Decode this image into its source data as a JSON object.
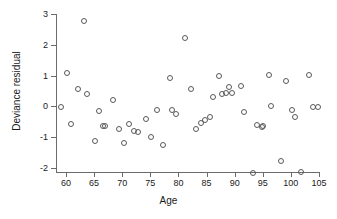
{
  "chart_data": {
    "type": "scatter",
    "title": "",
    "xlabel": "Age",
    "ylabel": "Deviance residual",
    "xlim": [
      58.0,
      105.5
    ],
    "ylim": [
      -2.35,
      3.0
    ],
    "xticks": [
      60,
      65,
      70,
      75,
      80,
      85,
      90,
      95,
      100,
      105
    ],
    "yticks": [
      -2,
      -1,
      0,
      1,
      2,
      3
    ],
    "xtick_labels": [
      "60",
      "65",
      "70",
      "75",
      "80",
      "85",
      "90",
      "95",
      "100",
      "105"
    ],
    "ytick_labels": [
      "-2",
      "-1",
      "0",
      "1",
      "2",
      "3"
    ],
    "grid": false,
    "legend": null,
    "marker": "open-circle",
    "marker_color": "#595959",
    "axis_color": "#6b6b6b",
    "points": [
      {
        "x": 59.0,
        "y": 0.0
      },
      {
        "x": 60.0,
        "y": 1.12
      },
      {
        "x": 60.7,
        "y": -0.54
      },
      {
        "x": 62.0,
        "y": 0.61
      },
      {
        "x": 63.0,
        "y": 2.8
      },
      {
        "x": 63.5,
        "y": 0.45
      },
      {
        "x": 65.0,
        "y": -1.1
      },
      {
        "x": 65.7,
        "y": -0.12
      },
      {
        "x": 66.4,
        "y": -0.62
      },
      {
        "x": 66.8,
        "y": -0.6
      },
      {
        "x": 68.2,
        "y": 0.23
      },
      {
        "x": 69.2,
        "y": -0.7
      },
      {
        "x": 70.1,
        "y": -1.17
      },
      {
        "x": 71.0,
        "y": -0.55
      },
      {
        "x": 72.0,
        "y": -0.78
      },
      {
        "x": 72.6,
        "y": -0.79
      },
      {
        "x": 74.0,
        "y": -0.38
      },
      {
        "x": 75.0,
        "y": -0.95
      },
      {
        "x": 76.0,
        "y": -0.1
      },
      {
        "x": 77.0,
        "y": -1.23
      },
      {
        "x": 78.4,
        "y": 0.95
      },
      {
        "x": 78.7,
        "y": -0.09
      },
      {
        "x": 79.4,
        "y": -0.2
      },
      {
        "x": 81.0,
        "y": 2.24
      },
      {
        "x": 82.0,
        "y": 0.61
      },
      {
        "x": 83.0,
        "y": -0.7
      },
      {
        "x": 83.9,
        "y": -0.5
      },
      {
        "x": 84.5,
        "y": -0.42
      },
      {
        "x": 85.4,
        "y": -0.3
      },
      {
        "x": 86.0,
        "y": 0.35
      },
      {
        "x": 87.0,
        "y": 1.01
      },
      {
        "x": 87.6,
        "y": 0.44
      },
      {
        "x": 88.2,
        "y": 0.46
      },
      {
        "x": 88.8,
        "y": 0.67
      },
      {
        "x": 89.4,
        "y": 0.48
      },
      {
        "x": 91.0,
        "y": 0.71
      },
      {
        "x": 91.4,
        "y": -0.15
      },
      {
        "x": 93.0,
        "y": -2.12
      },
      {
        "x": 93.8,
        "y": -0.58
      },
      {
        "x": 94.6,
        "y": -0.63
      },
      {
        "x": 94.9,
        "y": -0.62
      },
      {
        "x": 96.0,
        "y": 1.05
      },
      {
        "x": 96.3,
        "y": 0.04
      },
      {
        "x": 98.0,
        "y": -1.75
      },
      {
        "x": 99.0,
        "y": 0.86
      },
      {
        "x": 100.0,
        "y": -0.09
      },
      {
        "x": 100.6,
        "y": -0.32
      },
      {
        "x": 101.7,
        "y": -2.1
      },
      {
        "x": 103.0,
        "y": 1.06
      },
      {
        "x": 103.8,
        "y": 0.0
      },
      {
        "x": 104.6,
        "y": 0.0
      }
    ]
  }
}
